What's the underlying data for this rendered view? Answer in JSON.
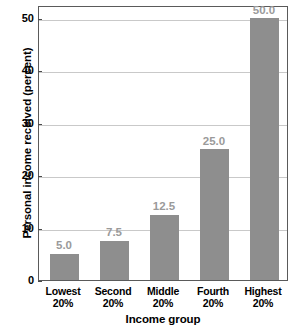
{
  "chart_data": {
    "type": "bar",
    "title": "",
    "subtitle": "",
    "xlabel": "Income group",
    "ylabel": "Personal income received (percent)",
    "categories": [
      "Lowest 20%",
      "Second 20%",
      "Middle 20%",
      "Fourth 20%",
      "Highest 20%"
    ],
    "category_lines": [
      [
        "Lowest",
        "20%"
      ],
      [
        "Second",
        "20%"
      ],
      [
        "Middle",
        "20%"
      ],
      [
        "Fourth",
        "20%"
      ],
      [
        "Highest",
        "20%"
      ]
    ],
    "values": [
      5.0,
      7.5,
      12.5,
      25.0,
      50.0
    ],
    "value_labels": [
      "5.0",
      "7.5",
      "12.5",
      "25.0",
      "50.0"
    ],
    "ylim": [
      0,
      52.5
    ],
    "yticks": [
      0,
      10,
      20,
      30,
      40,
      50
    ],
    "ytick_labels": [
      "0",
      "10",
      "20",
      "30",
      "40",
      "50"
    ],
    "grid": true,
    "grid_axis": "y",
    "legend": false,
    "legend_position": "none",
    "bar_color": "#8e8e8e",
    "value_label_color": "#9a9a9a",
    "gridline_color": "#c9c9c9",
    "frame_color": "#5a5a5a",
    "text_color": "#000000",
    "background_color": "#ffffff"
  }
}
